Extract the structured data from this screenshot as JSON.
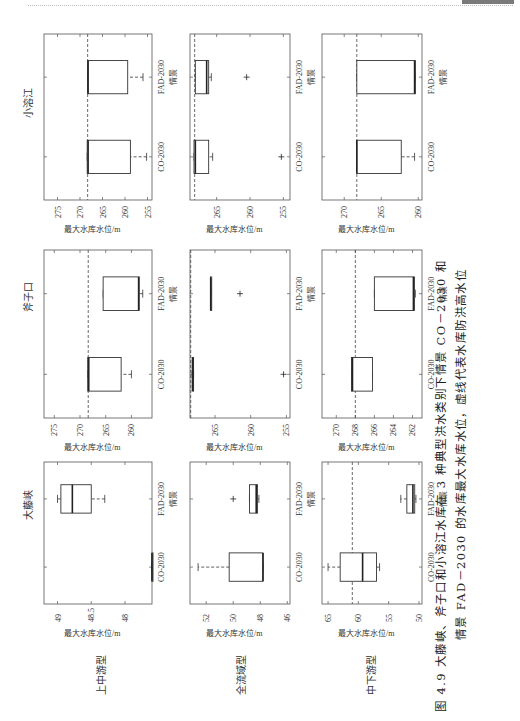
{
  "page": {
    "caption_line1": "图 4.9  大藤峡、斧子口和小溶江水库在 3 种典型洪水类别下情景 CO－2030 和",
    "caption_line2": "情景 FAD－2030 的水库最大水库水位，虚线代表水库防洪高水位",
    "reservoirs": [
      "小溶江",
      "斧子口",
      "大藤峡"
    ],
    "flood_types": [
      "上中游型",
      "全流域型",
      "中下游型"
    ]
  },
  "chart_data": {
    "type": "boxplot",
    "xlabel": "情景",
    "ylabel": "最大水库水位/m",
    "categories": [
      "CO-2030",
      "FAD-2030"
    ],
    "panels": [
      {
        "reservoir": "小溶江",
        "flood_type": "上中游型",
        "ylim": [
          254,
          278
        ],
        "yticks": [
          255,
          260,
          265,
          270,
          275
        ],
        "flood_control_level": 268.3,
        "boxes": [
          {
            "scenario": "CO-2030",
            "whisker_low": 255.2,
            "q1": 258.8,
            "median": 268.2,
            "q3": 268.4,
            "whisker_high": 268.4,
            "outliers": []
          },
          {
            "scenario": "FAD-2030",
            "whisker_low": 256.0,
            "q1": 259.4,
            "median": 268.2,
            "q3": 268.3,
            "whisker_high": 268.3,
            "outliers": []
          }
        ]
      },
      {
        "reservoir": "小溶江",
        "flood_type": "全流域型",
        "ylim": [
          254,
          269
        ],
        "yticks": [
          255,
          260,
          265
        ],
        "flood_control_level": 268.3,
        "boxes": [
          {
            "scenario": "CO-2030",
            "whisker_low": 265.6,
            "q1": 266.2,
            "median": 268.2,
            "q3": 268.4,
            "whisker_high": 268.4,
            "outliers": [
              255.3
            ]
          },
          {
            "scenario": "FAD-2030",
            "whisker_low": 265.8,
            "q1": 266.2,
            "median": 266.5,
            "q3": 268.2,
            "whisker_high": 268.2,
            "outliers": [
              260.5
            ]
          }
        ]
      },
      {
        "reservoir": "小溶江",
        "flood_type": "中下游型",
        "ylim": [
          259.5,
          273
        ],
        "yticks": [
          260,
          265,
          270
        ],
        "flood_control_level": 268.3,
        "boxes": [
          {
            "scenario": "CO-2030",
            "whisker_low": 260.5,
            "q1": 262.3,
            "median": 268.3,
            "q3": 268.3,
            "whisker_high": 268.3,
            "outliers": []
          },
          {
            "scenario": "FAD-2030",
            "whisker_low": 260.4,
            "q1": 260.4,
            "median": 260.5,
            "q3": 268.3,
            "whisker_high": 268.3,
            "outliers": []
          }
        ]
      },
      {
        "reservoir": "斧子口",
        "flood_type": "上中游型",
        "ylim": [
          256,
          277
        ],
        "yticks": [
          260,
          265,
          270,
          275
        ],
        "flood_control_level": 268.4,
        "boxes": [
          {
            "scenario": "CO-2030",
            "whisker_low": 260.0,
            "q1": 262.0,
            "median": 268.3,
            "q3": 268.5,
            "whisker_high": 268.5,
            "outliers": []
          },
          {
            "scenario": "FAD-2030",
            "whisker_low": 257.8,
            "q1": 258.5,
            "median": 258.6,
            "q3": 265.5,
            "whisker_high": 265.5,
            "outliers": []
          }
        ]
      },
      {
        "reservoir": "斧子口",
        "flood_type": "全流域型",
        "ylim": [
          254.5,
          268.5
        ],
        "yticks": [
          255,
          260,
          265
        ],
        "flood_control_level": 268.4,
        "boxes": [
          {
            "scenario": "CO-2030",
            "whisker_low": 268.0,
            "q1": 268.0,
            "median": 268.1,
            "q3": 268.2,
            "whisker_high": 268.2,
            "outliers": [
              255.4
            ]
          },
          {
            "scenario": "FAD-2030",
            "whisker_low": 265.6,
            "q1": 265.6,
            "median": 265.6,
            "q3": 265.6,
            "whisker_high": 265.6,
            "outliers": [
              261.5
            ]
          }
        ]
      },
      {
        "reservoir": "斧子口",
        "flood_type": "中下游型",
        "ylim": [
          261,
          271.5
        ],
        "yticks": [
          262,
          264,
          266,
          268,
          270
        ],
        "flood_control_level": 268.0,
        "boxes": [
          {
            "scenario": "CO-2030",
            "whisker_low": 266.2,
            "q1": 266.2,
            "median": 268.3,
            "q3": 268.4,
            "whisker_high": 268.4,
            "outliers": []
          },
          {
            "scenario": "FAD-2030",
            "whisker_low": 261.7,
            "q1": 261.8,
            "median": 261.9,
            "q3": 266.0,
            "whisker_high": 266.0,
            "outliers": []
          }
        ]
      },
      {
        "reservoir": "大藤峡",
        "flood_type": "上中游型",
        "ylim": [
          47.6,
          49.2
        ],
        "yticks": [
          48,
          48.5,
          49
        ],
        "flood_control_level": null,
        "boxes": [
          {
            "scenario": "CO-2030",
            "whisker_low": 47.6,
            "q1": 47.6,
            "median": 47.6,
            "q3": 47.6,
            "whisker_high": 47.6,
            "outliers": []
          },
          {
            "scenario": "FAD-2030",
            "whisker_low": 48.3,
            "q1": 48.5,
            "median": 48.78,
            "q3": 48.95,
            "whisker_high": 49.0,
            "outliers": []
          }
        ]
      },
      {
        "reservoir": "大藤峡",
        "flood_type": "全流域型",
        "ylim": [
          45.8,
          53.2
        ],
        "yticks": [
          46,
          48,
          50,
          52
        ],
        "flood_control_level": null,
        "boxes": [
          {
            "scenario": "CO-2030",
            "whisker_low": 47.8,
            "q1": 47.8,
            "median": 47.8,
            "q3": 50.3,
            "whisker_high": 52.6,
            "outliers": []
          },
          {
            "scenario": "FAD-2030",
            "whisker_low": 48.1,
            "q1": 48.2,
            "median": 48.3,
            "q3": 48.8,
            "whisker_high": 48.8,
            "outliers": [
              50.0
            ]
          }
        ]
      },
      {
        "reservoir": "大藤峡",
        "flood_type": "中下游型",
        "ylim": [
          49.5,
          66
        ],
        "yticks": [
          50,
          55,
          60,
          65
        ],
        "flood_control_level": 61.0,
        "boxes": [
          {
            "scenario": "CO-2030",
            "whisker_low": 56.5,
            "q1": 57.0,
            "median": 59.3,
            "q3": 63.0,
            "whisker_high": 65.0,
            "outliers": []
          },
          {
            "scenario": "FAD-2030",
            "whisker_low": 50.5,
            "q1": 50.7,
            "median": 51.0,
            "q3": 52.0,
            "whisker_high": 53.0,
            "outliers": []
          }
        ]
      }
    ]
  }
}
